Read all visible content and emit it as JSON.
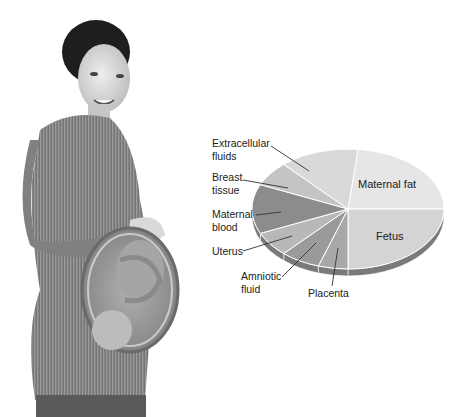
{
  "figure": {
    "illustration": "pregnant-woman-with-fetus-cutaway"
  },
  "chart_data": {
    "type": "pie",
    "title": "",
    "style": "3d-exploded-grayscale",
    "unit": "proportion of pregnancy weight gain",
    "slices": [
      {
        "label": "Maternal fat",
        "value": 7.0,
        "color": "#e6e6e6",
        "label_position": "inside"
      },
      {
        "label": "Fetus",
        "value": 7.5,
        "color": "#d4d4d4",
        "label_position": "inside"
      },
      {
        "label": "Placenta",
        "value": 1.5,
        "color": "#a8a8a8",
        "label_position": "outside"
      },
      {
        "label": "Amniotic fluid",
        "value": 2.0,
        "color": "#9a9a9a",
        "label_position": "outside"
      },
      {
        "label": "Uterus",
        "value": 2.0,
        "color": "#b8b8b8",
        "label_position": "outside"
      },
      {
        "label": "Maternal blood",
        "value": 4.0,
        "color": "#8c8c8c",
        "label_position": "outside"
      },
      {
        "label": "Breast tissue",
        "value": 2.0,
        "color": "#c4c4c4",
        "label_position": "outside"
      },
      {
        "label": "Extracellular fluids",
        "value": 4.0,
        "color": "#d9d9d9",
        "label_position": "outside"
      }
    ],
    "legend": "none (callout labels)"
  },
  "labels": {
    "maternal_fat": "Maternal fat",
    "fetus": "Fetus",
    "placenta": "Placenta",
    "amniotic_1": "Amniotic",
    "amniotic_2": "fluid",
    "uterus": "Uterus",
    "maternal_blood_1": "Maternal",
    "maternal_blood_2": "blood",
    "breast_1": "Breast",
    "breast_2": "tissue",
    "extracellular_1": "Extracellular",
    "extracellular_2": "fluids"
  }
}
